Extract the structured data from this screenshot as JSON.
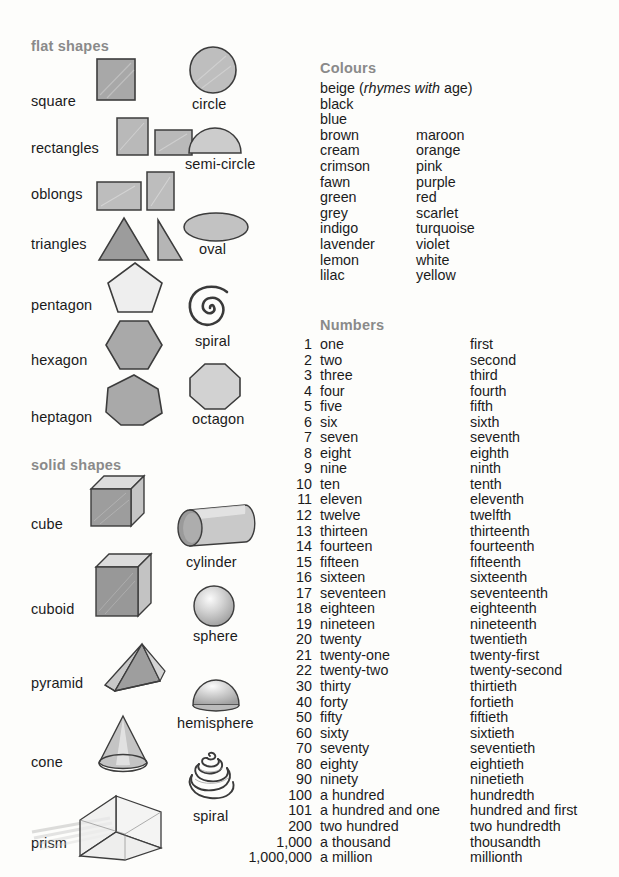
{
  "sections": {
    "flat_shapes_heading": "flat shapes",
    "solid_shapes_heading": "solid shapes",
    "colours_heading": "Colours",
    "numbers_heading": "Numbers"
  },
  "flat_shapes": {
    "left_column": [
      {
        "label": "square",
        "icon": "square-shape"
      },
      {
        "label": "rectangles",
        "icon": "rectangles-shape"
      },
      {
        "label": "oblongs",
        "icon": "oblongs-shape"
      },
      {
        "label": "triangles",
        "icon": "triangles-shape"
      },
      {
        "label": "pentagon",
        "icon": "pentagon-shape"
      },
      {
        "label": "hexagon",
        "icon": "hexagon-shape"
      },
      {
        "label": "heptagon",
        "icon": "heptagon-shape"
      }
    ],
    "right_column": [
      {
        "label": "circle",
        "icon": "circle-shape"
      },
      {
        "label": "semi-circle",
        "icon": "semi-circle-shape"
      },
      {
        "label": "oval",
        "icon": "oval-shape"
      },
      {
        "label": "spiral",
        "icon": "spiral-flat-shape"
      },
      {
        "label": "octagon",
        "icon": "octagon-shape"
      }
    ]
  },
  "solid_shapes": {
    "left_column": [
      {
        "label": "cube",
        "icon": "cube-shape"
      },
      {
        "label": "cuboid",
        "icon": "cuboid-shape"
      },
      {
        "label": "pyramid",
        "icon": "pyramid-shape"
      },
      {
        "label": "cone",
        "icon": "cone-shape"
      },
      {
        "label": "prism",
        "icon": "prism-shape"
      }
    ],
    "right_column": [
      {
        "label": "cylinder",
        "icon": "cylinder-shape"
      },
      {
        "label": "sphere",
        "icon": "sphere-shape"
      },
      {
        "label": "hemisphere",
        "icon": "hemisphere-shape"
      },
      {
        "label": "spiral",
        "icon": "spiral-solid-shape"
      }
    ]
  },
  "colours": {
    "rows": [
      {
        "a": "beige",
        "a_note_pre": " (",
        "a_note_italic": "rhymes with",
        "a_note_post": " age)",
        "b": ""
      },
      {
        "a": "black",
        "b": ""
      },
      {
        "a": "blue",
        "b": ""
      },
      {
        "a": "brown",
        "b": "maroon"
      },
      {
        "a": "cream",
        "b": "orange"
      },
      {
        "a": "crimson",
        "b": "pink"
      },
      {
        "a": "fawn",
        "b": "purple"
      },
      {
        "a": "green",
        "b": "red"
      },
      {
        "a": "grey",
        "b": "scarlet"
      },
      {
        "a": "indigo",
        "b": "turquoise"
      },
      {
        "a": "lavender",
        "b": "violet"
      },
      {
        "a": "lemon",
        "b": "white"
      },
      {
        "a": "lilac",
        "b": "yellow"
      }
    ]
  },
  "numbers": {
    "rows": [
      {
        "figure": "1",
        "cardinal": "one",
        "ordinal": "first"
      },
      {
        "figure": "2",
        "cardinal": "two",
        "ordinal": "second"
      },
      {
        "figure": "3",
        "cardinal": "three",
        "ordinal": "third"
      },
      {
        "figure": "4",
        "cardinal": "four",
        "ordinal": "fourth"
      },
      {
        "figure": "5",
        "cardinal": "five",
        "ordinal": "fifth"
      },
      {
        "figure": "6",
        "cardinal": "six",
        "ordinal": "sixth"
      },
      {
        "figure": "7",
        "cardinal": "seven",
        "ordinal": "seventh"
      },
      {
        "figure": "8",
        "cardinal": "eight",
        "ordinal": "eighth"
      },
      {
        "figure": "9",
        "cardinal": "nine",
        "ordinal": "ninth"
      },
      {
        "figure": "10",
        "cardinal": "ten",
        "ordinal": "tenth"
      },
      {
        "figure": "11",
        "cardinal": "eleven",
        "ordinal": "eleventh"
      },
      {
        "figure": "12",
        "cardinal": "twelve",
        "ordinal": "twelfth"
      },
      {
        "figure": "13",
        "cardinal": "thirteen",
        "ordinal": "thirteenth"
      },
      {
        "figure": "14",
        "cardinal": "fourteen",
        "ordinal": "fourteenth"
      },
      {
        "figure": "15",
        "cardinal": "fifteen",
        "ordinal": "fifteenth"
      },
      {
        "figure": "16",
        "cardinal": "sixteen",
        "ordinal": "sixteenth"
      },
      {
        "figure": "17",
        "cardinal": "seventeen",
        "ordinal": "seventeenth"
      },
      {
        "figure": "18",
        "cardinal": "eighteen",
        "ordinal": "eighteenth"
      },
      {
        "figure": "19",
        "cardinal": "nineteen",
        "ordinal": "nineteenth"
      },
      {
        "figure": "20",
        "cardinal": "twenty",
        "ordinal": "twentieth"
      },
      {
        "figure": "21",
        "cardinal": "twenty-one",
        "ordinal": "twenty-first"
      },
      {
        "figure": "22",
        "cardinal": "twenty-two",
        "ordinal": "twenty-second"
      },
      {
        "figure": "30",
        "cardinal": "thirty",
        "ordinal": "thirtieth"
      },
      {
        "figure": "40",
        "cardinal": "forty",
        "ordinal": "fortieth"
      },
      {
        "figure": "50",
        "cardinal": "fifty",
        "ordinal": "fiftieth"
      },
      {
        "figure": "60",
        "cardinal": "sixty",
        "ordinal": "sixtieth"
      },
      {
        "figure": "70",
        "cardinal": "seventy",
        "ordinal": "seventieth"
      },
      {
        "figure": "80",
        "cardinal": "eighty",
        "ordinal": "eightieth"
      },
      {
        "figure": "90",
        "cardinal": "ninety",
        "ordinal": "ninetieth"
      },
      {
        "figure": "100",
        "cardinal": "a hundred",
        "ordinal": "hundredth"
      },
      {
        "figure": "101",
        "cardinal": "a hundred and one",
        "ordinal": "hundred and first"
      },
      {
        "figure": "200",
        "cardinal": "two hundred",
        "ordinal": "two hundredth"
      },
      {
        "figure": "1,000",
        "cardinal": "a thousand",
        "ordinal": "thousandth"
      },
      {
        "figure": "1,000,000",
        "cardinal": "a million",
        "ordinal": "millionth"
      }
    ]
  },
  "colors": {
    "page_background": "#fdfdfb",
    "heading_grey": "#8a8a8a",
    "text_black": "#1b1b1b",
    "shape_outline": "#3a3a3a",
    "shape_fill_mid": "#b0b0b0",
    "shape_fill_dark": "#8f8f8f",
    "shape_fill_light": "#d8d8d8"
  }
}
